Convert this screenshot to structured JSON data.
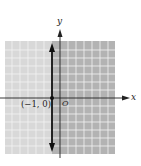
{
  "graph": {
    "x_axis_label": "x",
    "y_axis_label": "y",
    "origin_label": "O",
    "point_label": "(−1, 0)",
    "line": "x = -1",
    "shading": {
      "left_color": "#d6d6d6",
      "right_color": "#b4b4b4",
      "grid_color": "#ffffff"
    }
  }
}
